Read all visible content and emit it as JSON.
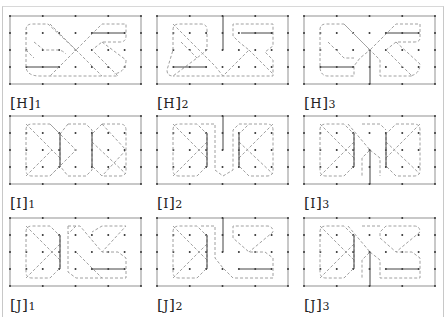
{
  "figure": {
    "style": {
      "frame_color": "#555555",
      "dot_color": "#333333",
      "dashed_color": "#a0a0a0",
      "solid_segment_color": "#444444"
    },
    "panels": [
      {
        "id": "H1",
        "label_letter": "H",
        "label_index": "1",
        "row": 0,
        "col": 0
      },
      {
        "id": "H2",
        "label_letter": "H",
        "label_index": "2",
        "row": 0,
        "col": 1
      },
      {
        "id": "H3",
        "label_letter": "H",
        "label_index": "3",
        "row": 0,
        "col": 2
      },
      {
        "id": "I1",
        "label_letter": "I",
        "label_index": "1",
        "row": 1,
        "col": 0
      },
      {
        "id": "I2",
        "label_letter": "I",
        "label_index": "2",
        "row": 1,
        "col": 1
      },
      {
        "id": "I3",
        "label_letter": "I",
        "label_index": "3",
        "row": 1,
        "col": 2
      },
      {
        "id": "J1",
        "label_letter": "J",
        "label_index": "1",
        "row": 2,
        "col": 0
      },
      {
        "id": "J2",
        "label_letter": "J",
        "label_index": "2",
        "row": 2,
        "col": 1
      },
      {
        "id": "J3",
        "label_letter": "J",
        "label_index": "3",
        "row": 2,
        "col": 2
      }
    ],
    "labels": {
      "H1": {
        "open": "[",
        "letter": "H",
        "close": "]",
        "index": "1"
      },
      "H2": {
        "open": "[",
        "letter": "H",
        "close": "]",
        "index": "2"
      },
      "H3": {
        "open": "[",
        "letter": "H",
        "close": "]",
        "index": "3"
      },
      "I1": {
        "open": "[",
        "letter": "I",
        "close": "]",
        "index": "1"
      },
      "I2": {
        "open": "[",
        "letter": "I",
        "close": "]",
        "index": "2"
      },
      "I3": {
        "open": "[",
        "letter": "I",
        "close": "]",
        "index": "3"
      },
      "J1": {
        "open": "[",
        "letter": "J",
        "close": "]",
        "index": "1"
      },
      "J2": {
        "open": "[",
        "letter": "J",
        "close": "]",
        "index": "2"
      },
      "J3": {
        "open": "[",
        "letter": "J",
        "close": "]",
        "index": "3"
      }
    }
  }
}
